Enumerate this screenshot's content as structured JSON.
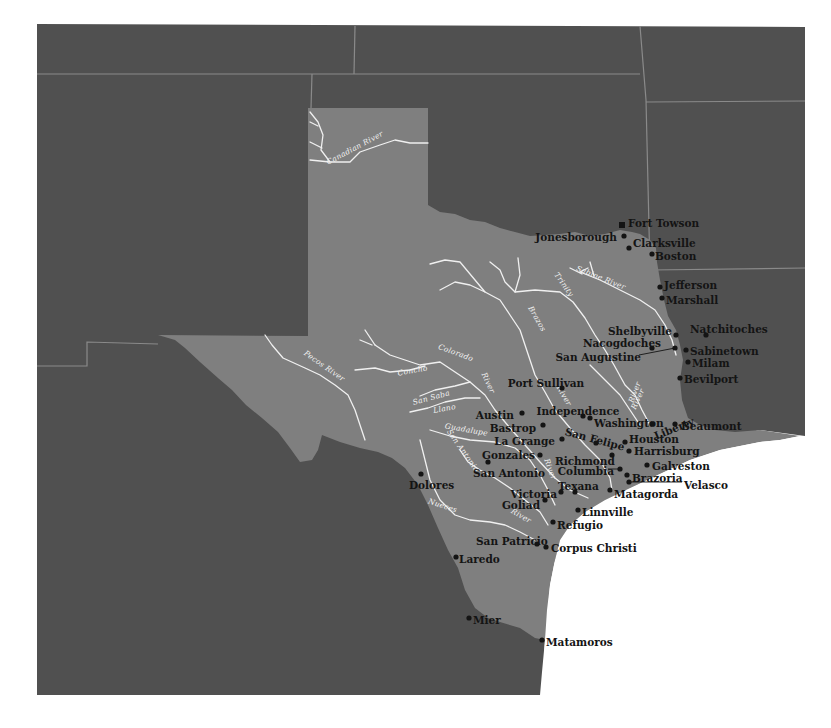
{
  "map": {
    "title": "Texas settlements and rivers",
    "colors": {
      "background": "#ffffff",
      "surrounding_land": "#505050",
      "texas": "#7f7f7f",
      "boundary_lines": "#8a8a8a",
      "rivers": "#f0f0f0",
      "town_labels": "#141414",
      "gulf": "#ffffff"
    },
    "rivers": [
      {
        "name": "Canadian River",
        "label": "Canadian River"
      },
      {
        "name": "Red River",
        "label": ""
      },
      {
        "name": "Sabine River",
        "label": "Sabine River"
      },
      {
        "name": "Trinity River",
        "label": "Trinity"
      },
      {
        "name": "Trinity River lower",
        "label": "River"
      },
      {
        "name": "Brazos River",
        "label": "Brazos"
      },
      {
        "name": "Brazos River lower",
        "label": "River"
      },
      {
        "name": "Colorado River",
        "label": "Colorado"
      },
      {
        "name": "Colorado River lower",
        "label": "River"
      },
      {
        "name": "Concho River",
        "label": "Concho"
      },
      {
        "name": "San Saba River",
        "label": "San Saba"
      },
      {
        "name": "Llano River",
        "label": "Llano"
      },
      {
        "name": "Guadalupe River",
        "label": "Guadalupe"
      },
      {
        "name": "San Antonio River",
        "label": "San Antonio"
      },
      {
        "name": "Nueces River",
        "label": "Nueces"
      },
      {
        "name": "Nueces River lower",
        "label": "River"
      },
      {
        "name": "Pecos River",
        "label": "Pecos River"
      },
      {
        "name": "Neches River",
        "label": "River"
      },
      {
        "name": "Lavaca River",
        "label": "River"
      }
    ],
    "towns": [
      {
        "name": "Fort Towson",
        "marker": "square"
      },
      {
        "name": "Jonesborough",
        "marker": "dot"
      },
      {
        "name": "Clarksville",
        "marker": "dot"
      },
      {
        "name": "Boston",
        "marker": "dot"
      },
      {
        "name": "Jefferson",
        "marker": "dot"
      },
      {
        "name": "Marshall",
        "marker": "dot"
      },
      {
        "name": "Natchitoches",
        "marker": "dot"
      },
      {
        "name": "Shelbyville",
        "marker": "dot"
      },
      {
        "name": "Nacogdoches",
        "marker": "dot"
      },
      {
        "name": "San Augustine",
        "marker": "dot"
      },
      {
        "name": "Sabinetown",
        "marker": "dot"
      },
      {
        "name": "Milam",
        "marker": "dot"
      },
      {
        "name": "Bevilport",
        "marker": "dot"
      },
      {
        "name": "Port Sullivan",
        "marker": "dot"
      },
      {
        "name": "Independence",
        "marker": "dot"
      },
      {
        "name": "Washington",
        "marker": "dot"
      },
      {
        "name": "Austin",
        "marker": "dot"
      },
      {
        "name": "Bastrop",
        "marker": "dot"
      },
      {
        "name": "San Felipe",
        "marker": "dot"
      },
      {
        "name": "Liberty",
        "marker": "dot"
      },
      {
        "name": "Beaumont",
        "marker": "dot"
      },
      {
        "name": "La Grange",
        "marker": "dot"
      },
      {
        "name": "Houston",
        "marker": "dot"
      },
      {
        "name": "Harrisburg",
        "marker": "dot"
      },
      {
        "name": "Gonzales",
        "marker": "dot"
      },
      {
        "name": "Richmond",
        "marker": "dot"
      },
      {
        "name": "Galveston",
        "marker": "dot"
      },
      {
        "name": "San Antonio",
        "marker": "dot"
      },
      {
        "name": "Columbia",
        "marker": "dot"
      },
      {
        "name": "Brazoria",
        "marker": "dot"
      },
      {
        "name": "Velasco",
        "marker": "dot"
      },
      {
        "name": "Dolores",
        "marker": "dot"
      },
      {
        "name": "Texana",
        "marker": "dot"
      },
      {
        "name": "Victoria",
        "marker": "dot"
      },
      {
        "name": "Matagorda",
        "marker": "dot"
      },
      {
        "name": "Goliad",
        "marker": "dot"
      },
      {
        "name": "Linnville",
        "marker": "dot"
      },
      {
        "name": "Refugio",
        "marker": "dot"
      },
      {
        "name": "San Patricio",
        "marker": "dot"
      },
      {
        "name": "Corpus Christi",
        "marker": "dot"
      },
      {
        "name": "Laredo",
        "marker": "dot"
      },
      {
        "name": "Mier",
        "marker": "dot"
      },
      {
        "name": "Matamoros",
        "marker": "dot"
      }
    ]
  }
}
